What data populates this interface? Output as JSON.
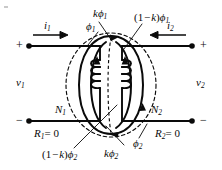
{
  "figure": {
    "type": "circuit-diagram",
    "ink_color": "#0a0a0a",
    "background": "#ffffff"
  },
  "labels": {
    "current_left": {
      "base": "i",
      "sub": "1",
      "text": "i1"
    },
    "current_right": {
      "base": "i",
      "sub": "2",
      "text": "i2"
    },
    "voltage_left": {
      "base": "v",
      "sub": "1",
      "text": "v1"
    },
    "voltage_right": {
      "base": "v",
      "sub": "2",
      "text": "v2"
    },
    "flux_left": {
      "base": "ϕ",
      "sub": "1",
      "text": "ϕ1"
    },
    "flux_right": {
      "base": "ϕ",
      "sub": "2",
      "text": "ϕ2"
    },
    "flux_k_phi1": {
      "prefix": "k",
      "base": "ϕ",
      "sub": "1",
      "text": "kϕ1"
    },
    "flux_1mk_phi1": {
      "prefix": "(1 − k)",
      "base": "ϕ",
      "sub": "1",
      "text": "(1 − k)ϕ1"
    },
    "flux_k_phi2": {
      "prefix": "k",
      "base": "ϕ",
      "sub": "2",
      "text": "kϕ2"
    },
    "flux_1mk_phi2": {
      "prefix": "(1 − k)",
      "base": "ϕ",
      "sub": "2",
      "text": "(1 − k)ϕ2"
    },
    "turns_left": {
      "base": "N",
      "sub": "1",
      "text": "N1"
    },
    "turns_right": {
      "base": "N",
      "sub": "2",
      "text": "N2"
    },
    "reluctance_left": {
      "base": "R",
      "sub": "1",
      "value": "= 0",
      "text": "R1 = 0"
    },
    "reluctance_right": {
      "base": "R",
      "sub": "2",
      "value": "= 0",
      "text": "R2 = 0"
    },
    "polarity_top_left": "+",
    "polarity_bottom_left": "−",
    "polarity_top_right": "+",
    "polarity_bottom_right": "−"
  },
  "geometry": {
    "coil_turns_left": 4,
    "coil_turns_right": 4,
    "terminals": 4,
    "core_legs": 2
  }
}
